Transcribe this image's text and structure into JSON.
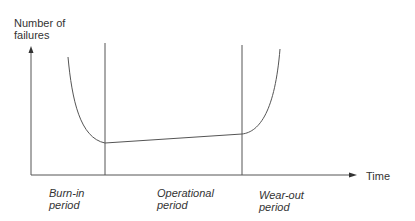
{
  "diagram": {
    "y_axis_label_line1": "Number of",
    "y_axis_label_line2": "failures",
    "x_axis_label": "Time",
    "periods": [
      {
        "line1": "Burn-in",
        "line2": "period"
      },
      {
        "line1": "Operational",
        "line2": "period"
      },
      {
        "line1": "Wear-out",
        "line2": "period"
      }
    ],
    "colors": {
      "line": "#555555",
      "text": "#333333",
      "background": "#ffffff"
    }
  }
}
